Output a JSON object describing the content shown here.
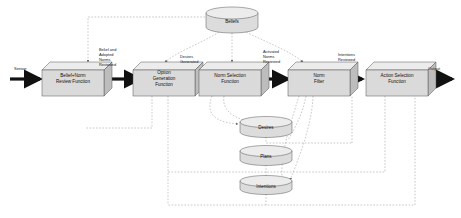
{
  "diagram": {
    "background": "#ffffff",
    "style": {
      "box_fill": "#d8d8d8",
      "box_top_fill": "#eaeaea",
      "box_side_fill": "#c2c2c2",
      "box_stroke": "#555555",
      "cylinder_fill": "#dcdcdc",
      "cylinder_top_fill": "#ececec",
      "cylinder_stroke": "#555555",
      "solid_arrow": "#111111",
      "dashed_line": "#9a9a9a"
    },
    "io": {
      "input_label": "Sensor",
      "output_label": "Output"
    },
    "process_boxes": [
      {
        "id": "belief-norm-review-function",
        "line1": "Belief+Norm",
        "line2": "Review Function",
        "line3": ""
      },
      {
        "id": "option-generation-function",
        "line1": "Option",
        "line2": "Generation",
        "line3": "Function"
      },
      {
        "id": "norm-selection-function",
        "line1": "Norm Selection",
        "line2": "Function",
        "line3": ""
      },
      {
        "id": "norm-filter",
        "line1": "Norm",
        "line2": "Filter",
        "line3": ""
      },
      {
        "id": "action-selection-function",
        "line1": "Action Selection",
        "line2": "Function",
        "line3": ""
      }
    ],
    "flow_labels": [
      {
        "id": "belief-and-adopted-norms-reviewed",
        "line1": "Belief and",
        "line2": "Adopted",
        "line3": "Norms",
        "line4": "Reviewed"
      },
      {
        "id": "desires-generated",
        "line1": "Desires",
        "line2": "Generated",
        "line3": "",
        "line4": ""
      },
      {
        "id": "activated-norms-reviewed",
        "line1": "Activated",
        "line2": "Norms",
        "line3": "Reviewed",
        "line4": ""
      },
      {
        "id": "intentions-reviewed",
        "line1": "Intentions",
        "line2": "Reviewed",
        "line3": "",
        "line4": ""
      }
    ],
    "data_stores": [
      {
        "id": "beliefs",
        "label": "Beliefs"
      },
      {
        "id": "desires",
        "label": "Desires"
      },
      {
        "id": "plans",
        "label": "Plans"
      },
      {
        "id": "intentions",
        "label": "Intentions"
      }
    ]
  }
}
